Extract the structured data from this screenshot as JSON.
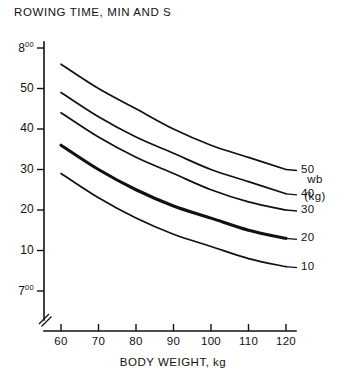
{
  "chart_data": {
    "type": "line",
    "title": "ROWING TIME, MIN AND S",
    "xlabel": "BODY WEIGHT, kg",
    "ylabel": "ROWING TIME, MIN AND S",
    "grid": false,
    "legend_position": "right",
    "legend_title": "wb",
    "legend_units": "(kg)",
    "x": [
      60,
      70,
      80,
      90,
      100,
      110,
      120
    ],
    "xtick_labels": [
      "60",
      "70",
      "80",
      "90",
      "100",
      "110",
      "120"
    ],
    "xlim": [
      60,
      120
    ],
    "ylim_seconds": [
      420,
      480
    ],
    "y_axis_break": true,
    "ytick_labels": [
      "8",
      "50",
      "40",
      "30",
      "20",
      "10",
      "7"
    ],
    "ytick_superscripts": [
      "00",
      "",
      "",
      "",
      "",
      "",
      "00"
    ],
    "ytick_seconds": [
      480,
      470,
      460,
      450,
      440,
      430,
      420
    ],
    "series": [
      {
        "name": "50",
        "legend_label": "50",
        "emphasis": false,
        "values_seconds": [
          476,
          470,
          465,
          460,
          456,
          453,
          450
        ],
        "values_time": [
          "7:56",
          "7:50",
          "7:45",
          "7:40",
          "7:36",
          "7:33",
          "7:30"
        ]
      },
      {
        "name": "40",
        "legend_label": "40",
        "emphasis": false,
        "values_seconds": [
          469,
          463,
          458,
          454,
          450,
          447,
          444
        ],
        "values_time": [
          "7:49",
          "7:43",
          "7:38",
          "7:34",
          "7:30",
          "7:27",
          "7:24"
        ]
      },
      {
        "name": "30",
        "legend_label": "30",
        "emphasis": false,
        "values_seconds": [
          464,
          458,
          453,
          449,
          445,
          442,
          440
        ],
        "values_time": [
          "7:44",
          "7:38",
          "7:33",
          "7:29",
          "7:25",
          "7:22",
          "7:20"
        ]
      },
      {
        "name": "20",
        "legend_label": "20",
        "emphasis": true,
        "values_seconds": [
          456,
          450,
          445,
          441,
          438,
          435,
          433
        ],
        "values_time": [
          "7:36",
          "7:30",
          "7:25",
          "7:21",
          "7:18",
          "7:15",
          "7:13"
        ]
      },
      {
        "name": "10",
        "legend_label": "10",
        "emphasis": false,
        "values_seconds": [
          449,
          443,
          438,
          434,
          431,
          428,
          426
        ],
        "values_time": [
          "7:29",
          "7:23",
          "7:18",
          "7:14",
          "7:11",
          "7:08",
          "7:06"
        ]
      }
    ]
  },
  "labels": {
    "title": "ROWING TIME, MIN AND S",
    "x_axis_title": "BODY WEIGHT, kg",
    "legend_title": "wb",
    "legend_units": "(kg)"
  },
  "colors": {
    "ink": "#111111",
    "background": "#ffffff"
  }
}
